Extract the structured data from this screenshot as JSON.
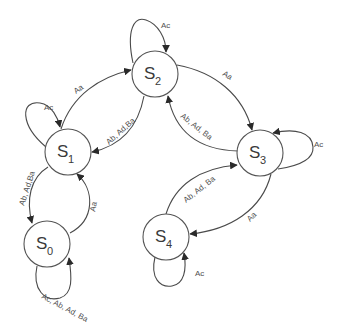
{
  "diagram": {
    "type": "state-transition",
    "colors": {
      "stroke": "#555555",
      "text": "#3a3a3a",
      "background": "#ffffff"
    },
    "nodes": [
      {
        "id": "S0",
        "letter": "S",
        "sub": "0"
      },
      {
        "id": "S1",
        "letter": "S",
        "sub": "1"
      },
      {
        "id": "S2",
        "letter": "S",
        "sub": "2"
      },
      {
        "id": "S3",
        "letter": "S",
        "sub": "3"
      },
      {
        "id": "S4",
        "letter": "S",
        "sub": "4"
      }
    ],
    "edges": [
      {
        "from": "S1",
        "to": "S1",
        "label": "Ac"
      },
      {
        "from": "S1",
        "to": "S2",
        "label": "Aa"
      },
      {
        "from": "S2",
        "to": "S1",
        "label": "Ab, Ad,Ba"
      },
      {
        "from": "S2",
        "to": "S2",
        "label": "Ac"
      },
      {
        "from": "S2",
        "to": "S3",
        "label": "Aa"
      },
      {
        "from": "S3",
        "to": "S2",
        "label": "Ab, Ad, Ba"
      },
      {
        "from": "S3",
        "to": "S3",
        "label": "Ac"
      },
      {
        "from": "S1",
        "to": "S0",
        "label": "Ab, Ad,Ba"
      },
      {
        "from": "S0",
        "to": "S1",
        "label": "Aa"
      },
      {
        "from": "S0",
        "to": "S0",
        "label": "Ac, Ab, Ad, Ba"
      },
      {
        "from": "S4",
        "to": "S3",
        "label": "Ab, Ad, Ba"
      },
      {
        "from": "S3",
        "to": "S4",
        "label": "Aa"
      },
      {
        "from": "S4",
        "to": "S4",
        "label": "Ac"
      }
    ]
  }
}
